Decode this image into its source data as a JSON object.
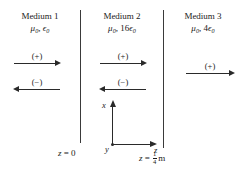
{
  "figure": {
    "background_color": "#ffffff",
    "ink_color": "#1a1a1a"
  },
  "media": [
    {
      "title": "Medium 1",
      "permeability": "μ",
      "permeability_sub": "0",
      "separator": ", ",
      "permittivity_coeff": "",
      "permittivity": "ϵ",
      "permittivity_sub": "0"
    },
    {
      "title": "Medium 2",
      "permeability": "μ",
      "permeability_sub": "0",
      "separator": ", ",
      "permittivity_coeff": "16",
      "permittivity": "ϵ",
      "permittivity_sub": "0"
    },
    {
      "title": "Medium 3",
      "permeability": "μ",
      "permeability_sub": "0",
      "separator": ", ",
      "permittivity_coeff": "4",
      "permittivity": "ϵ",
      "permittivity_sub": "0"
    }
  ],
  "waves": [
    {
      "sign": "(+)",
      "direction": "right",
      "region": "medium-1"
    },
    {
      "sign": "(−)",
      "direction": "left",
      "region": "medium-1"
    },
    {
      "sign": "(+)",
      "direction": "right",
      "region": "medium-2"
    },
    {
      "sign": "(−)",
      "direction": "left",
      "region": "medium-2"
    },
    {
      "sign": "(+)",
      "direction": "right",
      "region": "medium-3"
    }
  ],
  "axes": {
    "vertical_label": "x",
    "horizontal_label": "z",
    "origin_label": "y"
  },
  "boundaries": [
    {
      "name": "left-boundary",
      "label_var": "z",
      "label_eq": " = ",
      "label_value": "0",
      "label_unit": ""
    },
    {
      "name": "right-boundary",
      "label_var": "z",
      "label_eq": " = ",
      "fraction_numerator": "1",
      "fraction_denominator": "4",
      "label_unit": "m"
    }
  ]
}
